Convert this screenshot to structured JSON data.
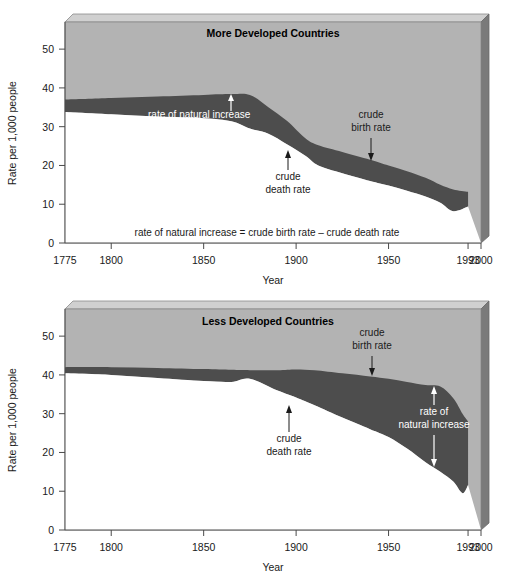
{
  "figure": {
    "panels": [
      "more-developed",
      "less-developed"
    ],
    "colors": {
      "birth_band_fill": "#b3b3b3",
      "natural_increase_fill": "#4d4d4d",
      "death_area_fill": "#ffffff",
      "box_top_face": "#d0d0d0",
      "box_side_face": "#7a7a7a",
      "axis": "#4a4a4a",
      "text": "#1a1a1a",
      "annotation_light": "#ffffff"
    }
  },
  "chart_data": [
    {
      "type": "area",
      "id": "more-developed",
      "title": "More Developed Countries",
      "xlabel": "Year",
      "ylabel": "Rate per 1,000 people",
      "xlim": [
        1775,
        2000
      ],
      "ylim": [
        0,
        57
      ],
      "xticks": [
        1775,
        1800,
        1850,
        1900,
        1950,
        1993,
        2000
      ],
      "xticklabels": [
        "1775",
        "1800",
        "1850",
        "1900",
        "1950",
        "1993",
        "2000"
      ],
      "yticks": [
        0,
        10,
        20,
        30,
        40,
        50
      ],
      "yticklabels": [
        "0",
        "10",
        "20",
        "30",
        "40",
        "50"
      ],
      "grid": false,
      "legend": "none",
      "x": [
        1775,
        1800,
        1825,
        1850,
        1865,
        1875,
        1885,
        1895,
        1905,
        1912,
        1925,
        1940,
        1950,
        1960,
        1970,
        1978,
        1985,
        1993
      ],
      "series": [
        {
          "name": "crude birth rate",
          "values": [
            37.0,
            37.4,
            37.8,
            38.2,
            38.4,
            38.2,
            35.0,
            31.5,
            27.0,
            25.2,
            23.5,
            21.5,
            20.0,
            18.5,
            16.8,
            15.0,
            13.8,
            13.2
          ]
        },
        {
          "name": "crude death rate",
          "values": [
            33.8,
            33.2,
            32.6,
            32.2,
            31.4,
            29.5,
            28.2,
            25.5,
            22.5,
            20.0,
            18.0,
            16.0,
            14.8,
            13.5,
            12.0,
            10.4,
            8.2,
            9.4
          ]
        }
      ],
      "annotations": [
        {
          "id": "rate-of-natural-increase",
          "text": "rate of natural increase",
          "x": 1862,
          "style": "light",
          "arrows": "both"
        },
        {
          "id": "crude-birth-rate",
          "text": "crude birth rate",
          "x": 1940,
          "style": "dark",
          "arrows": "down"
        },
        {
          "id": "crude-death-rate",
          "text": "crude death rate",
          "x": 1895,
          "style": "dark",
          "arrows": "up"
        }
      ],
      "formula": "rate of natural increase = crude birth rate – crude death rate"
    },
    {
      "type": "area",
      "id": "less-developed",
      "title": "Less Developed Countries",
      "xlabel": "Year",
      "ylabel": "Rate per 1,000 people",
      "xlim": [
        1775,
        2000
      ],
      "ylim": [
        0,
        57
      ],
      "xticks": [
        1775,
        1800,
        1850,
        1900,
        1950,
        1993,
        2000
      ],
      "xticklabels": [
        "1775",
        "1800",
        "1850",
        "1900",
        "1950",
        "1993",
        "2000"
      ],
      "yticks": [
        0,
        10,
        20,
        30,
        40,
        50
      ],
      "yticklabels": [
        "0",
        "10",
        "20",
        "30",
        "40",
        "50"
      ],
      "grid": false,
      "legend": "none",
      "x": [
        1775,
        1800,
        1825,
        1850,
        1865,
        1875,
        1890,
        1900,
        1910,
        1925,
        1940,
        1950,
        1960,
        1970,
        1978,
        1985,
        1990,
        1993
      ],
      "series": [
        {
          "name": "crude birth rate",
          "values": [
            42.0,
            42.0,
            41.8,
            41.5,
            41.3,
            41.2,
            41.2,
            41.4,
            41.2,
            40.4,
            39.6,
            39.0,
            38.2,
            37.4,
            37.0,
            34.0,
            30.0,
            28.0
          ]
        },
        {
          "name": "crude death rate",
          "values": [
            40.4,
            40.0,
            39.2,
            38.4,
            38.2,
            39.0,
            36.0,
            34.2,
            32.2,
            29.0,
            26.0,
            24.0,
            21.0,
            17.5,
            15.0,
            12.5,
            9.5,
            11.6
          ]
        }
      ],
      "annotations": [
        {
          "id": "crude-birth-rate",
          "text": "crude birth rate",
          "x": 1940,
          "style": "dark",
          "arrows": "down"
        },
        {
          "id": "crude-death-rate",
          "text": "crude death rate",
          "x": 1895,
          "style": "dark",
          "arrows": "up"
        },
        {
          "id": "rate-of-natural-increase",
          "text": "rate of natural increase",
          "x": 1962,
          "style": "light",
          "arrows": "both"
        }
      ],
      "formula": ""
    }
  ],
  "annotation_text": {
    "rate_of_natural_increase": "rate of natural increase",
    "rate_of": "rate of",
    "natural_increase": "natural increase",
    "crude": "crude",
    "birth_rate": "birth rate",
    "death_rate": "death rate"
  }
}
